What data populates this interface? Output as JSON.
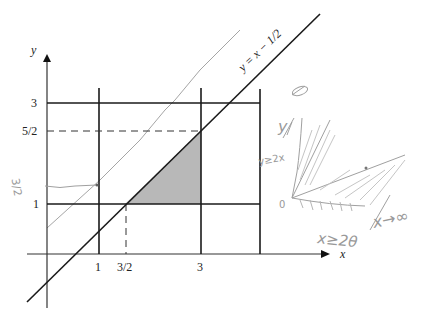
{
  "diagram": {
    "type": "region-of-integration",
    "axes": {
      "x_label": "x",
      "y_label": "y",
      "x_ticks": [
        "1",
        "3/2",
        "3"
      ],
      "y_ticks": [
        "1",
        "5/2",
        "3"
      ]
    },
    "line_label": "y = x − 1/2",
    "shaded_region": "triangle with vertices (3/2,1), (3,1), (3,5/2)",
    "colors": {
      "ink": "#1a1a1a",
      "shade": "#b8b8b8",
      "pencil": "#9a9a9a"
    },
    "handwritten": {
      "left_margin": "3/2",
      "top_right": "θ",
      "y_label": "y",
      "inequality_left": "y≥2x",
      "origin": "0",
      "x_note": "x→∞",
      "bottom_note": "x≥2θ"
    }
  }
}
